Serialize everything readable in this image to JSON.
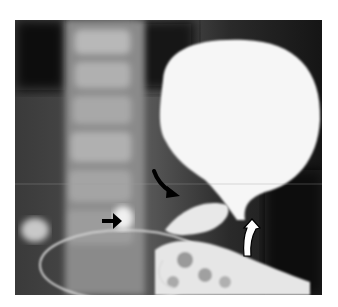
{
  "figure": {
    "type": "radiograph",
    "annotations": [
      {
        "name": "straight-arrow",
        "color": "#000000",
        "direction": "right"
      },
      {
        "name": "curved-arrow",
        "color": "#000000",
        "direction": "down-right"
      },
      {
        "name": "open-curved-arrow",
        "color": "#ffffff",
        "outline": "#000000",
        "direction": "up"
      }
    ]
  }
}
